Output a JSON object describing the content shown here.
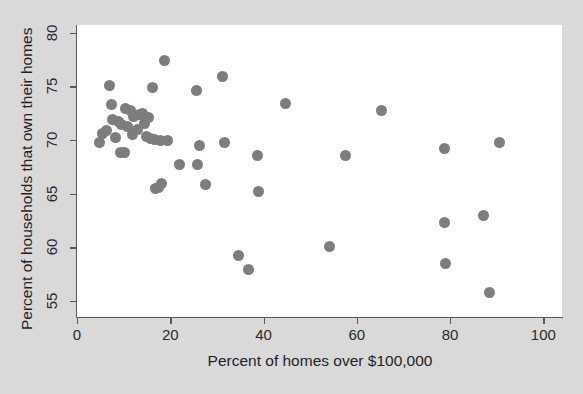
{
  "chart_data": {
    "type": "scatter",
    "title": "",
    "xlabel": "Percent of homes over $100,000",
    "ylabel": "Percent of households that own their homes",
    "xlim": [
      0,
      104
    ],
    "ylim": [
      53.5,
      80.7
    ],
    "xticks": [
      0,
      20,
      40,
      60,
      80,
      100
    ],
    "yticks": [
      55,
      60,
      65,
      70,
      75,
      80
    ],
    "xtick_labels": [
      "0",
      "20",
      "40",
      "60",
      "80",
      "100"
    ],
    "ytick_labels": [
      "55",
      "60",
      "65",
      "70",
      "75",
      "80"
    ],
    "grid": false,
    "legend": null,
    "marker_color": "#7d7d7d",
    "marker_size": 11,
    "plot_background": "#ffffff",
    "figure_background": "#d9d9d9",
    "axis_color": "#5a5a5a",
    "points": [
      {
        "x": 4.8,
        "y": 69.8
      },
      {
        "x": 5.4,
        "y": 70.6
      },
      {
        "x": 6.3,
        "y": 70.9
      },
      {
        "x": 7.0,
        "y": 75.1
      },
      {
        "x": 7.3,
        "y": 73.3
      },
      {
        "x": 7.6,
        "y": 71.9
      },
      {
        "x": 8.2,
        "y": 70.2
      },
      {
        "x": 8.9,
        "y": 71.7
      },
      {
        "x": 9.4,
        "y": 68.8
      },
      {
        "x": 9.6,
        "y": 71.4
      },
      {
        "x": 10.2,
        "y": 68.8
      },
      {
        "x": 10.5,
        "y": 72.9
      },
      {
        "x": 10.8,
        "y": 71.2
      },
      {
        "x": 11.4,
        "y": 72.7
      },
      {
        "x": 11.8,
        "y": 70.5
      },
      {
        "x": 12.1,
        "y": 72.2
      },
      {
        "x": 12.6,
        "y": 72.3
      },
      {
        "x": 13.0,
        "y": 71.0
      },
      {
        "x": 13.4,
        "y": 72.4
      },
      {
        "x": 14.1,
        "y": 72.5
      },
      {
        "x": 14.4,
        "y": 71.5
      },
      {
        "x": 14.8,
        "y": 70.3
      },
      {
        "x": 15.3,
        "y": 72.1
      },
      {
        "x": 15.8,
        "y": 70.1
      },
      {
        "x": 16.2,
        "y": 74.9
      },
      {
        "x": 16.6,
        "y": 70.0
      },
      {
        "x": 16.9,
        "y": 65.5
      },
      {
        "x": 17.4,
        "y": 65.6
      },
      {
        "x": 17.8,
        "y": 69.9
      },
      {
        "x": 18.2,
        "y": 65.9
      },
      {
        "x": 18.7,
        "y": 77.4
      },
      {
        "x": 19.3,
        "y": 69.9
      },
      {
        "x": 21.9,
        "y": 67.7
      },
      {
        "x": 25.6,
        "y": 74.6
      },
      {
        "x": 25.9,
        "y": 67.7
      },
      {
        "x": 26.2,
        "y": 69.5
      },
      {
        "x": 27.6,
        "y": 65.8
      },
      {
        "x": 31.2,
        "y": 75.9
      },
      {
        "x": 31.7,
        "y": 69.8
      },
      {
        "x": 34.6,
        "y": 59.2
      },
      {
        "x": 36.7,
        "y": 57.9
      },
      {
        "x": 38.8,
        "y": 68.5
      },
      {
        "x": 39.0,
        "y": 65.2
      },
      {
        "x": 44.8,
        "y": 73.4
      },
      {
        "x": 54.1,
        "y": 60.1
      },
      {
        "x": 57.6,
        "y": 68.5
      },
      {
        "x": 65.3,
        "y": 72.7
      },
      {
        "x": 78.8,
        "y": 69.2
      },
      {
        "x": 78.9,
        "y": 62.3
      },
      {
        "x": 79.1,
        "y": 58.5
      },
      {
        "x": 87.2,
        "y": 63.0
      },
      {
        "x": 88.5,
        "y": 55.8
      },
      {
        "x": 90.6,
        "y": 69.8
      }
    ]
  }
}
